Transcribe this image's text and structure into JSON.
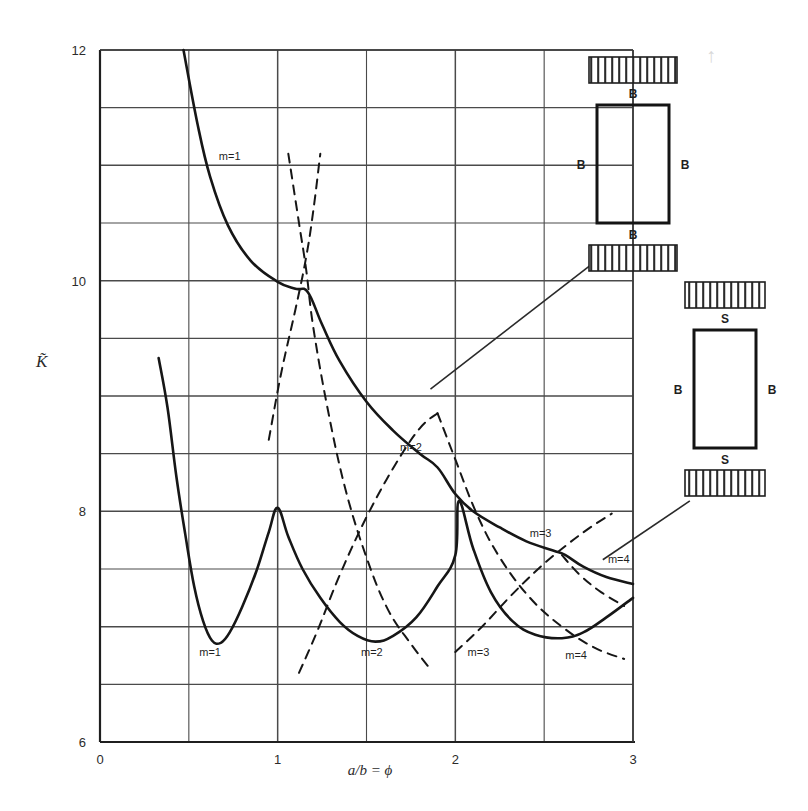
{
  "figure": {
    "background": "#ffffff",
    "ink": "#1f1f1f",
    "grid_color": "#5a5a5a",
    "y_axis_label": "K̃",
    "x_axis_label": "a/b = ϕ"
  },
  "chart_data": {
    "type": "line",
    "title": "",
    "xlabel": "a/b = ϕ",
    "ylabel": "K̃",
    "xlim": [
      0,
      3
    ],
    "ylim": [
      6,
      12
    ],
    "xticks": [
      0,
      1,
      2,
      3
    ],
    "xtick_labels": [
      "0",
      "1",
      "2",
      "3"
    ],
    "yticks": [
      6,
      8,
      10,
      12
    ],
    "ytick_labels": [
      "6",
      "8",
      "10",
      "12"
    ],
    "grid": true,
    "grid_x_step": 0.5,
    "grid_y_step": 0.5,
    "legend": "none",
    "series": [
      {
        "name": "upper-solid-BBBB",
        "style": "solid",
        "label_points": [
          {
            "text": "m=1",
            "x": 0.73,
            "y": 11.05
          },
          {
            "text": "m=2",
            "x": 1.75,
            "y": 8.52
          },
          {
            "text": "m=3",
            "x": 2.48,
            "y": 7.78
          },
          {
            "text": "m=4",
            "x": 2.92,
            "y": 7.55
          }
        ],
        "points": [
          {
            "x": 0.47,
            "y": 12.0
          },
          {
            "x": 0.55,
            "y": 11.35
          },
          {
            "x": 0.62,
            "y": 10.9
          },
          {
            "x": 0.72,
            "y": 10.48
          },
          {
            "x": 0.85,
            "y": 10.17
          },
          {
            "x": 1.0,
            "y": 9.99
          },
          {
            "x": 1.1,
            "y": 9.93
          },
          {
            "x": 1.17,
            "y": 9.9
          },
          {
            "x": 1.25,
            "y": 9.62
          },
          {
            "x": 1.35,
            "y": 9.3
          },
          {
            "x": 1.5,
            "y": 8.95
          },
          {
            "x": 1.65,
            "y": 8.7
          },
          {
            "x": 1.8,
            "y": 8.5
          },
          {
            "x": 1.9,
            "y": 8.38
          },
          {
            "x": 2.0,
            "y": 8.15
          },
          {
            "x": 2.1,
            "y": 8.0
          },
          {
            "x": 2.25,
            "y": 7.86
          },
          {
            "x": 2.4,
            "y": 7.74
          },
          {
            "x": 2.55,
            "y": 7.66
          },
          {
            "x": 2.62,
            "y": 7.62
          },
          {
            "x": 2.72,
            "y": 7.52
          },
          {
            "x": 2.85,
            "y": 7.43
          },
          {
            "x": 3.0,
            "y": 7.37
          }
        ]
      },
      {
        "name": "lower-solid-SBSB",
        "style": "solid",
        "label_points": [
          {
            "text": "m=1",
            "x": 0.62,
            "y": 6.75
          },
          {
            "text": "m=2",
            "x": 1.53,
            "y": 6.75
          },
          {
            "text": "m=3",
            "x": 2.13,
            "y": 6.75
          },
          {
            "text": "m=4",
            "x": 2.68,
            "y": 6.72
          }
        ],
        "points": [
          {
            "x": 0.33,
            "y": 9.33
          },
          {
            "x": 0.38,
            "y": 8.9
          },
          {
            "x": 0.43,
            "y": 8.3
          },
          {
            "x": 0.48,
            "y": 7.8
          },
          {
            "x": 0.53,
            "y": 7.35
          },
          {
            "x": 0.58,
            "y": 7.05
          },
          {
            "x": 0.63,
            "y": 6.88
          },
          {
            "x": 0.68,
            "y": 6.86
          },
          {
            "x": 0.73,
            "y": 6.95
          },
          {
            "x": 0.8,
            "y": 7.17
          },
          {
            "x": 0.88,
            "y": 7.48
          },
          {
            "x": 0.95,
            "y": 7.82
          },
          {
            "x": 1.0,
            "y": 8.03
          },
          {
            "x": 1.06,
            "y": 7.78
          },
          {
            "x": 1.14,
            "y": 7.5
          },
          {
            "x": 1.24,
            "y": 7.25
          },
          {
            "x": 1.35,
            "y": 7.04
          },
          {
            "x": 1.45,
            "y": 6.92
          },
          {
            "x": 1.55,
            "y": 6.87
          },
          {
            "x": 1.65,
            "y": 6.92
          },
          {
            "x": 1.78,
            "y": 7.08
          },
          {
            "x": 1.9,
            "y": 7.35
          },
          {
            "x": 2.0,
            "y": 7.62
          },
          {
            "x": 2.02,
            "y": 8.09
          },
          {
            "x": 2.1,
            "y": 7.68
          },
          {
            "x": 2.2,
            "y": 7.3
          },
          {
            "x": 2.32,
            "y": 7.05
          },
          {
            "x": 2.45,
            "y": 6.93
          },
          {
            "x": 2.6,
            "y": 6.9
          },
          {
            "x": 2.72,
            "y": 6.95
          },
          {
            "x": 2.85,
            "y": 7.08
          },
          {
            "x": 3.0,
            "y": 7.25
          }
        ]
      },
      {
        "name": "dashed-branch-1",
        "style": "dashed",
        "points": [
          {
            "x": 0.95,
            "y": 8.62
          },
          {
            "x": 1.02,
            "y": 9.2
          },
          {
            "x": 1.1,
            "y": 9.75
          },
          {
            "x": 1.16,
            "y": 10.2
          },
          {
            "x": 1.2,
            "y": 10.6
          },
          {
            "x": 1.24,
            "y": 11.1
          }
        ]
      },
      {
        "name": "dashed-branch-2",
        "style": "dashed",
        "points": [
          {
            "x": 1.06,
            "y": 11.1
          },
          {
            "x": 1.12,
            "y": 10.5
          },
          {
            "x": 1.16,
            "y": 10.1
          },
          {
            "x": 1.2,
            "y": 9.6
          },
          {
            "x": 1.28,
            "y": 8.9
          },
          {
            "x": 1.38,
            "y": 8.2
          },
          {
            "x": 1.5,
            "y": 7.6
          },
          {
            "x": 1.62,
            "y": 7.15
          },
          {
            "x": 1.75,
            "y": 6.85
          },
          {
            "x": 1.85,
            "y": 6.65
          }
        ]
      },
      {
        "name": "dashed-branch-3",
        "style": "dashed",
        "points": [
          {
            "x": 1.12,
            "y": 6.6
          },
          {
            "x": 1.22,
            "y": 6.95
          },
          {
            "x": 1.35,
            "y": 7.45
          },
          {
            "x": 1.5,
            "y": 7.95
          },
          {
            "x": 1.66,
            "y": 8.4
          },
          {
            "x": 1.8,
            "y": 8.72
          },
          {
            "x": 1.9,
            "y": 8.85
          }
        ]
      },
      {
        "name": "dashed-branch-4",
        "style": "dashed",
        "points": [
          {
            "x": 1.9,
            "y": 8.85
          },
          {
            "x": 2.0,
            "y": 8.45
          },
          {
            "x": 2.12,
            "y": 7.98
          },
          {
            "x": 2.25,
            "y": 7.6
          },
          {
            "x": 2.42,
            "y": 7.25
          },
          {
            "x": 2.6,
            "y": 7.0
          },
          {
            "x": 2.78,
            "y": 6.82
          },
          {
            "x": 2.95,
            "y": 6.72
          }
        ]
      },
      {
        "name": "dashed-branch-5",
        "style": "dashed",
        "points": [
          {
            "x": 2.0,
            "y": 6.78
          },
          {
            "x": 2.15,
            "y": 7.0
          },
          {
            "x": 2.32,
            "y": 7.28
          },
          {
            "x": 2.48,
            "y": 7.52
          },
          {
            "x": 2.62,
            "y": 7.7
          },
          {
            "x": 2.75,
            "y": 7.85
          },
          {
            "x": 2.88,
            "y": 7.98
          }
        ]
      },
      {
        "name": "dashed-branch-6",
        "style": "dashed",
        "points": [
          {
            "x": 2.6,
            "y": 7.62
          },
          {
            "x": 2.7,
            "y": 7.45
          },
          {
            "x": 2.82,
            "y": 7.3
          },
          {
            "x": 2.95,
            "y": 7.18
          }
        ]
      }
    ],
    "annotations": [
      {
        "name": "leader-line-upper",
        "from_x": 1.86,
        "from_y": 9.06,
        "to_x": 2.9,
        "to_y": 10.3
      },
      {
        "name": "leader-line-lower",
        "from_x": 2.83,
        "from_y": 7.58,
        "to_x": 3.32,
        "to_y": 8.09
      }
    ]
  },
  "insets": [
    {
      "name": "boundary-condition-all-clamped",
      "edges": {
        "top": "B",
        "right": "B",
        "bottom": "B",
        "left": "B"
      },
      "hatch_top": true,
      "hatch_bottom": true
    },
    {
      "name": "boundary-condition-simply-supported-ends",
      "edges": {
        "top": "S",
        "right": "B",
        "bottom": "S",
        "left": "B"
      },
      "hatch_top": true,
      "hatch_bottom": true
    }
  ],
  "artifacts": {
    "corner_mark": "↑"
  }
}
